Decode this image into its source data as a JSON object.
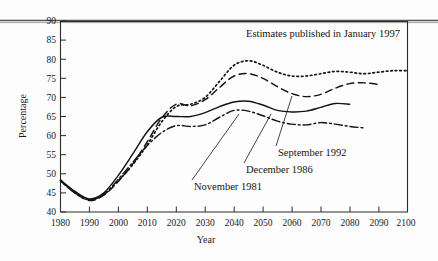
{
  "chart_data": {
    "type": "line",
    "title": "Estimates published in January 1997",
    "xlabel": "Year",
    "ylabel": "Percentage",
    "xlim": [
      1980,
      2100
    ],
    "ylim": [
      40,
      90
    ],
    "xticks": [
      1980,
      1990,
      2000,
      2010,
      2020,
      2030,
      2040,
      2050,
      2060,
      2070,
      2080,
      2090,
      2100
    ],
    "yticks": [
      40,
      45,
      50,
      55,
      60,
      65,
      70,
      75,
      80,
      85,
      90
    ],
    "grid": false,
    "legend_position": "inline-annotations",
    "series": [
      {
        "name": "January 1997",
        "style": "dotted",
        "annotation": "Estimates published in January 1997",
        "x": [
          1980,
          1985,
          1990,
          1995,
          2000,
          2005,
          2010,
          2015,
          2020,
          2025,
          2030,
          2035,
          2040,
          2045,
          2050,
          2055,
          2060,
          2065,
          2070,
          2075,
          2080,
          2085,
          2090,
          2095,
          2100
        ],
        "y": [
          48.2,
          45.0,
          43.2,
          44.6,
          48.2,
          52.4,
          57.6,
          63.6,
          67.6,
          68.2,
          70.0,
          74.2,
          78.4,
          79.6,
          78.4,
          76.6,
          75.6,
          75.6,
          76.2,
          76.8,
          76.6,
          76.2,
          76.6,
          77.0,
          77.0
        ]
      },
      {
        "name": "September 1992",
        "style": "dashed",
        "annotation": "September 1992",
        "x": [
          1980,
          1985,
          1990,
          1995,
          2000,
          2005,
          2010,
          2015,
          2020,
          2025,
          2030,
          2035,
          2040,
          2045,
          2050,
          2055,
          2060,
          2065,
          2070,
          2075,
          2080,
          2085,
          2090
        ],
        "y": [
          48.2,
          45.0,
          43.0,
          44.4,
          48.0,
          52.6,
          58.4,
          64.6,
          68.2,
          67.8,
          69.4,
          72.6,
          75.6,
          76.2,
          75.0,
          72.8,
          71.0,
          70.2,
          70.8,
          72.4,
          73.6,
          73.8,
          73.4
        ]
      },
      {
        "name": "December 1986",
        "style": "solid",
        "annotation": "December 1986",
        "x": [
          1980,
          1985,
          1990,
          1995,
          2000,
          2005,
          2010,
          2015,
          2020,
          2025,
          2030,
          2035,
          2040,
          2045,
          2050,
          2055,
          2060,
          2065,
          2070,
          2075,
          2080
        ],
        "y": [
          48.4,
          45.4,
          43.4,
          45.0,
          49.6,
          55.2,
          61.0,
          64.8,
          65.0,
          65.0,
          66.0,
          67.6,
          68.8,
          69.0,
          68.0,
          66.6,
          66.2,
          66.4,
          67.4,
          68.4,
          68.2
        ]
      },
      {
        "name": "November 1981",
        "style": "dash-dot",
        "annotation": "November 1981",
        "x": [
          1980,
          1985,
          1990,
          1995,
          2000,
          2005,
          2010,
          2015,
          2020,
          2025,
          2030,
          2035,
          2040,
          2045,
          2050,
          2055,
          2060,
          2065,
          2070,
          2075,
          2080,
          2085
        ],
        "y": [
          48.2,
          45.0,
          43.2,
          44.6,
          48.6,
          53.0,
          57.4,
          60.8,
          62.6,
          62.4,
          62.8,
          64.8,
          66.6,
          66.4,
          65.2,
          63.8,
          63.0,
          62.8,
          63.4,
          63.0,
          62.4,
          62.0
        ]
      }
    ]
  },
  "colors": {
    "ink": "#141414",
    "axis": "#2b2b2b",
    "background": "#fdfdfd",
    "artifact": "#4a4a4a"
  }
}
